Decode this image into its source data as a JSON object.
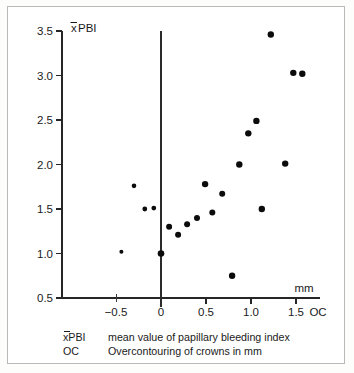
{
  "chart_data": {
    "type": "scatter",
    "title": "",
    "xlabel": "OC",
    "ylabel": "xPBI",
    "x_axis_unit": "mm",
    "xlim": [
      -0.75,
      1.78
    ],
    "ylim": [
      0.5,
      3.5
    ],
    "x_ticks": [
      -0.5,
      0,
      0.5,
      1.0,
      1.5
    ],
    "x_tick_labels": [
      "−0.5",
      "0",
      "0.5",
      "1.0",
      "1.5"
    ],
    "y_ticks": [
      0.5,
      1.0,
      1.5,
      2.0,
      2.5,
      3.0,
      3.5
    ],
    "y_tick_labels": [
      "0.5",
      "1.0",
      "1.5",
      "2.0",
      "2.5",
      "3.0",
      "3.5"
    ],
    "grid": false,
    "legend": "none",
    "zero_reference_line": 0,
    "points": [
      {
        "x": -0.44,
        "y": 1.02
      },
      {
        "x": -0.3,
        "y": 1.76
      },
      {
        "x": -0.18,
        "y": 1.5
      },
      {
        "x": -0.08,
        "y": 1.51
      },
      {
        "x": 0.0,
        "y": 1.0
      },
      {
        "x": 0.09,
        "y": 1.3
      },
      {
        "x": 0.19,
        "y": 1.21
      },
      {
        "x": 0.29,
        "y": 1.33
      },
      {
        "x": 0.4,
        "y": 1.4
      },
      {
        "x": 0.49,
        "y": 1.78
      },
      {
        "x": 0.57,
        "y": 1.46
      },
      {
        "x": 0.68,
        "y": 1.67
      },
      {
        "x": 0.79,
        "y": 0.75
      },
      {
        "x": 0.87,
        "y": 2.0
      },
      {
        "x": 0.97,
        "y": 2.35
      },
      {
        "x": 1.06,
        "y": 2.49
      },
      {
        "x": 1.12,
        "y": 1.5
      },
      {
        "x": 1.22,
        "y": 3.46
      },
      {
        "x": 1.38,
        "y": 2.01
      },
      {
        "x": 1.47,
        "y": 3.03
      },
      {
        "x": 1.57,
        "y": 3.02
      }
    ]
  },
  "axis_labels": {
    "y_axis_title_prefix": "x",
    "y_axis_title_rest": "PBI",
    "x_axis_unit": "mm",
    "x_axis_title": "OC"
  },
  "legend_notes": [
    {
      "key_prefix": "x",
      "key_rest": "PBI",
      "description": "mean value of papillary bleeding index"
    },
    {
      "key_prefix": "",
      "key_rest": "OC",
      "description": "Overcontouring of crowns in mm"
    }
  ]
}
